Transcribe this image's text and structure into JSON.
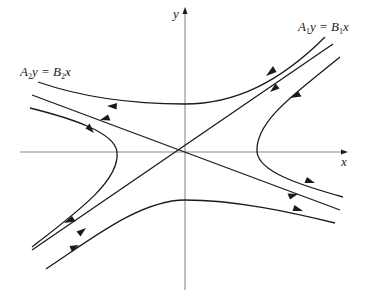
{
  "figure": {
    "type": "phase-portrait",
    "axes": {
      "x_label": "x",
      "y_label": "y",
      "origin": [
        185,
        152
      ]
    },
    "eigenlines": [
      {
        "id": "line-1",
        "label_main_a": "A",
        "label_sub_a": "1",
        "label_mid": "y = ",
        "label_main_b": "B",
        "label_sub_b": "1",
        "label_tail": "x",
        "direction": "incoming toward origin (stable)",
        "label_position": "upper-right"
      },
      {
        "id": "line-2",
        "label_main_a": "A",
        "label_sub_a": "2",
        "label_mid": "y = ",
        "label_main_b": "B",
        "label_sub_b": "2",
        "label_tail": "x",
        "direction": "outgoing from origin (unstable)",
        "label_position": "upper-left"
      }
    ],
    "trajectories": [
      {
        "id": "upper",
        "description": "upper hyperbola, flows right to left"
      },
      {
        "id": "right",
        "description": "right hyperbola, flows in from upper-right then out to lower-right"
      },
      {
        "id": "left",
        "description": "left hyperbola, flows in from lower-left then out to upper-left"
      },
      {
        "id": "lower",
        "description": "lower hyperbola, flows left to right"
      }
    ]
  }
}
